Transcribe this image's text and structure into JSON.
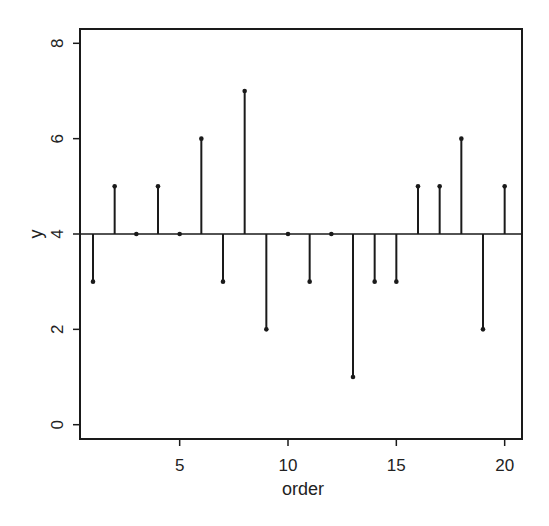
{
  "chart_data": {
    "type": "stem",
    "title": "",
    "xlabel": "order",
    "ylabel": "y",
    "x": [
      1,
      2,
      3,
      4,
      5,
      6,
      7,
      8,
      9,
      10,
      11,
      12,
      13,
      14,
      15,
      16,
      17,
      18,
      19,
      20
    ],
    "values": [
      3,
      5,
      4,
      5,
      4,
      6,
      3,
      7,
      2,
      4,
      3,
      4,
      1,
      3,
      3,
      5,
      5,
      6,
      2,
      5
    ],
    "baseline": 4,
    "xlim": [
      0.4,
      20.8
    ],
    "ylim": [
      -0.3,
      8.3
    ],
    "xticks": [
      5,
      10,
      15,
      20
    ],
    "xtick_labels": [
      "5",
      "10",
      "15",
      "20"
    ],
    "yticks": [
      0,
      2,
      4,
      6,
      8
    ],
    "ytick_labels": [
      "0",
      "2",
      "4",
      "6",
      "8"
    ],
    "grid": false,
    "legend": "none",
    "colors": {
      "stem": "#1a1a1a",
      "axis": "#1a1a1a",
      "background": "#ffffff"
    }
  }
}
